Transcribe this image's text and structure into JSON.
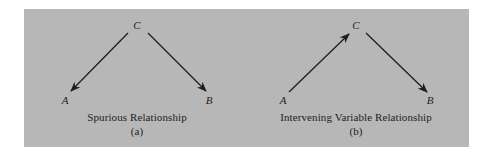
{
  "colors": {
    "panel_background": "#b7b7b7",
    "ink": "#1e1e1e",
    "page_background": "#ffffff"
  },
  "diagrams": [
    {
      "id": "a",
      "nodes": {
        "top": "C",
        "left": "A",
        "right": "B"
      },
      "edges": [
        {
          "from": "C",
          "to": "A"
        },
        {
          "from": "C",
          "to": "B"
        }
      ],
      "caption": "Spurious Relationship",
      "sublabel": "(a)"
    },
    {
      "id": "b",
      "nodes": {
        "top": "C",
        "left": "A",
        "right": "B"
      },
      "edges": [
        {
          "from": "A",
          "to": "C"
        },
        {
          "from": "C",
          "to": "B"
        }
      ],
      "caption": "Intervening Variable Relationship",
      "sublabel": "(b)"
    }
  ]
}
